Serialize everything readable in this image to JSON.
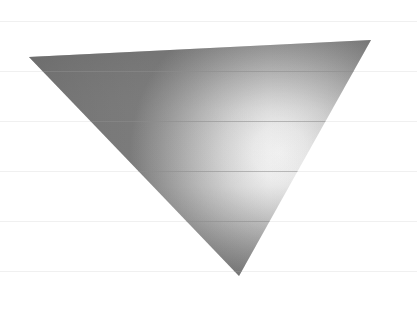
{
  "canvas": {
    "width": 417,
    "height": 310,
    "background_color": "#ffffff",
    "title_text": ""
  },
  "gridlines": {
    "orientation": "horizontal",
    "color": "#f0f0f0",
    "color_over_shape": "#8d8d8d",
    "stroke_width": 1,
    "count": 6,
    "y_positions": [
      21,
      71,
      121,
      171,
      221,
      271
    ],
    "x_start": 0,
    "x_end": 417,
    "label": "ruled-background-lines"
  },
  "shape": {
    "name": "downward-triangle",
    "kind": "triangle",
    "orientation": "point-down",
    "vertices": [
      {
        "name": "top-left",
        "x": 29,
        "y": 57
      },
      {
        "name": "top-right",
        "x": 371,
        "y": 40
      },
      {
        "name": "bottom-apex",
        "x": 239,
        "y": 276
      }
    ],
    "points_attr": "29,57 371,40 239,276",
    "fill_style": "radial-metallic-gradient",
    "edge_color": "none",
    "gradient": {
      "type": "radial",
      "highlight_center_x": 280,
      "highlight_center_y": 152,
      "highlight_radius": 150,
      "stops": [
        {
          "offset": "0%",
          "color": "#f4f4f4"
        },
        {
          "offset": "18%",
          "color": "#ededed"
        },
        {
          "offset": "38%",
          "color": "#d8d8d8"
        },
        {
          "offset": "58%",
          "color": "#bdbdbd"
        },
        {
          "offset": "76%",
          "color": "#a2a2a2"
        },
        {
          "offset": "90%",
          "color": "#8d8d8d"
        },
        {
          "offset": "100%",
          "color": "#7e7e7e"
        }
      ],
      "shade_overlay": {
        "type": "linear",
        "direction": "top-to-bottom",
        "stops": [
          {
            "offset": "0%",
            "color": "rgba(90,90,90,0.30)"
          },
          {
            "offset": "30%",
            "color": "rgba(120,120,120,0.05)"
          },
          {
            "offset": "62%",
            "color": "rgba(120,120,120,0.00)"
          },
          {
            "offset": "88%",
            "color": "rgba(80,80,80,0.26)"
          },
          {
            "offset": "100%",
            "color": "rgba(70,70,70,0.38)"
          }
        ]
      },
      "left_shade": {
        "type": "linear",
        "direction": "left-to-right",
        "stops": [
          {
            "offset": "0%",
            "color": "rgba(95,95,95,0.40)"
          },
          {
            "offset": "35%",
            "color": "rgba(110,110,110,0.12)"
          },
          {
            "offset": "70%",
            "color": "rgba(110,110,110,0.00)"
          },
          {
            "offset": "100%",
            "color": "rgba(100,100,100,0.10)"
          }
        ]
      }
    }
  },
  "chart_data": {
    "type": "scatter",
    "title": "",
    "xlabel": "",
    "ylabel": "",
    "grid": true,
    "legend_position": "none",
    "xlim": [
      0,
      417
    ],
    "ylim": [
      0,
      310
    ],
    "tick_labels": {
      "x": [],
      "y": []
    },
    "annotations": [],
    "series": [
      {
        "name": "downward-triangle",
        "shape": "triangle",
        "x": [
          29,
          371,
          239
        ],
        "y": [
          57,
          40,
          276
        ]
      }
    ],
    "gridline_y_values": [
      21,
      71,
      121,
      171,
      221,
      271
    ]
  }
}
